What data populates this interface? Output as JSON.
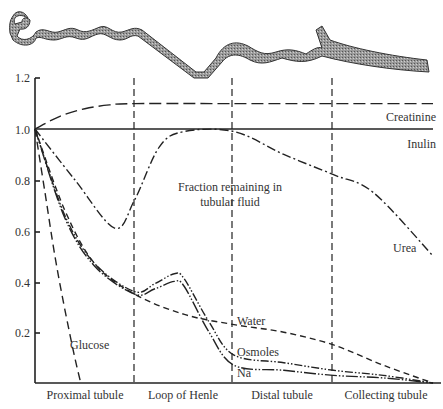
{
  "chart_data": {
    "type": "line",
    "title": "Fraction remaining in tubular fluid",
    "xlabel": "",
    "ylabel": "",
    "ylim": [
      0,
      1.2
    ],
    "yticks": [
      "0.2",
      "0.4",
      "0.6",
      "0.8",
      "1.0",
      "1.2"
    ],
    "grid": false,
    "categories": [
      "Proximal tubule",
      "Loop of Henle",
      "Distal tubule",
      "Collecting tubule"
    ],
    "x_note": "x measured in nephron segments, 0 = start of proximal tubule, 4 = end of collecting tubule",
    "series": [
      {
        "name": "Creatinine",
        "style": "long-dash",
        "x": [
          0,
          0.25,
          0.5,
          0.75,
          1.0,
          2.0,
          3.0,
          4.0
        ],
        "values": [
          1.0,
          1.05,
          1.08,
          1.095,
          1.1,
          1.1,
          1.1,
          1.1
        ]
      },
      {
        "name": "Inulin",
        "style": "solid",
        "x": [
          0,
          1,
          2,
          3,
          4
        ],
        "values": [
          1.0,
          1.0,
          1.0,
          1.0,
          1.0
        ]
      },
      {
        "name": "Urea",
        "style": "dash-dot",
        "x": [
          0,
          0.4,
          0.8,
          1.0,
          1.25,
          1.5,
          2.0,
          2.5,
          3.0,
          3.4,
          4.0
        ],
        "values": [
          1.0,
          0.8,
          0.61,
          0.72,
          0.93,
          0.99,
          0.99,
          0.9,
          0.82,
          0.75,
          0.5
        ]
      },
      {
        "name": "Glucose",
        "style": "dashed",
        "x": [
          0,
          0.1,
          0.2,
          0.3,
          0.4,
          0.46
        ],
        "values": [
          1.0,
          0.75,
          0.5,
          0.29,
          0.1,
          0.0
        ]
      },
      {
        "name": "Water",
        "style": "short-dash",
        "x": [
          0,
          0.3,
          0.6,
          1.0,
          1.5,
          2.0,
          2.5,
          3.0,
          3.5,
          4.0
        ],
        "values": [
          1.0,
          0.68,
          0.47,
          0.35,
          0.27,
          0.23,
          0.2,
          0.15,
          0.07,
          0.0
        ]
      },
      {
        "name": "Osmoles",
        "style": "dash-dot-dot",
        "x": [
          0,
          0.3,
          0.6,
          1.0,
          1.2,
          1.4,
          1.5,
          1.75,
          2.0,
          2.5,
          3.0,
          3.5,
          4.0
        ],
        "values": [
          1.0,
          0.66,
          0.47,
          0.36,
          0.39,
          0.43,
          0.41,
          0.24,
          0.11,
          0.08,
          0.05,
          0.03,
          0.0
        ]
      },
      {
        "name": "Na",
        "style": "dash-dot-dot-long",
        "x": [
          0,
          0.3,
          0.6,
          1.0,
          1.2,
          1.4,
          1.5,
          1.75,
          2.0,
          2.5,
          3.0,
          3.5,
          4.0
        ],
        "values": [
          1.0,
          0.65,
          0.46,
          0.35,
          0.37,
          0.4,
          0.38,
          0.2,
          0.07,
          0.05,
          0.03,
          0.02,
          0.0
        ]
      }
    ],
    "annotations": [
      {
        "text": "Fraction remaining in",
        "x": 1.95,
        "y": 0.62
      },
      {
        "text": "tubular fluid",
        "x": 1.95,
        "y": 0.57
      },
      {
        "text": "Creatinine",
        "x": 3.95,
        "y": 1.13
      },
      {
        "text": "Inulin",
        "x": 3.95,
        "y": 1.03
      },
      {
        "text": "Urea",
        "x": 3.55,
        "y": 0.52
      },
      {
        "text": "Glucose",
        "x": 0.6,
        "y": 0.16
      },
      {
        "text": "Water",
        "x": 2.05,
        "y": 0.24
      },
      {
        "text": "Osmoles",
        "x": 2.05,
        "y": 0.13
      },
      {
        "text": "Na",
        "x": 2.05,
        "y": 0.04
      }
    ],
    "segment_dividers": [
      1,
      2,
      3
    ],
    "illustration": "stippled schematic of a nephron tubule above the plot"
  }
}
